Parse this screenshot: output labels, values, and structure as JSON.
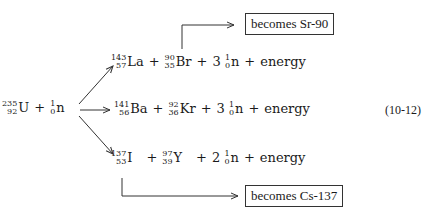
{
  "reactant": {
    "uranium": {
      "mass": "235",
      "atomic": "92",
      "symbol": "U"
    },
    "plus": "+",
    "neutron": {
      "mass": "1",
      "atomic": "0",
      "symbol": "n"
    }
  },
  "reactions": [
    {
      "products": [
        {
          "mass": "143",
          "atomic": "57",
          "symbol": "La"
        },
        {
          "mass": "90",
          "atomic": "35",
          "symbol": "Br"
        }
      ],
      "neutron_count": "3",
      "neutron": {
        "mass": "1",
        "atomic": "0",
        "symbol": "n"
      },
      "plus": "+",
      "energy": "energy"
    },
    {
      "products": [
        {
          "mass": "141",
          "atomic": "56",
          "symbol": "Ba"
        },
        {
          "mass": "92",
          "atomic": "36",
          "symbol": "Kr"
        }
      ],
      "neutron_count": "3",
      "neutron": {
        "mass": "1",
        "atomic": "0",
        "symbol": "n"
      },
      "plus": "+",
      "energy": "energy"
    },
    {
      "products": [
        {
          "mass": "137",
          "atomic": "53",
          "symbol": "I"
        },
        {
          "mass": "97",
          "atomic": "39",
          "symbol": "Y"
        }
      ],
      "neutron_count": "2",
      "neutron": {
        "mass": "1",
        "atomic": "0",
        "symbol": "n"
      },
      "plus": "+",
      "energy": "energy"
    }
  ],
  "callouts": {
    "top": "becomes Sr-90",
    "bottom": "becomes Cs-137"
  },
  "equation_number": "(10-12)",
  "colors": {
    "ink": "#1a1a1a",
    "line": "#333333"
  }
}
